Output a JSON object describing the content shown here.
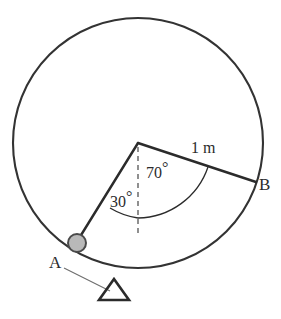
{
  "figure": {
    "type": "physics-diagram",
    "colors": {
      "stroke": "#2b2b2b",
      "circle_stroke": "#333333",
      "ball_fill": "#b9b9b9",
      "ball_stroke": "#4a4a4a",
      "leader_line": "#6e6e6e",
      "dashed_line": "#555555",
      "background": "#ffffff",
      "text": "#2b2b2b"
    },
    "geometry": {
      "circle": {
        "cx": 138,
        "cy": 143,
        "r": 125
      },
      "pivot": {
        "x": 138,
        "y": 143
      },
      "point_a": {
        "x": 77,
        "y": 243
      },
      "point_b": {
        "x": 255,
        "y": 182
      },
      "ball_radius": 9,
      "dashed_reference_end": {
        "x": 138,
        "y": 232
      },
      "angle_a_deg": 30,
      "angle_b_deg": 70,
      "radius_length": "1 m"
    }
  },
  "labels": {
    "point_a": "A",
    "point_b": "B",
    "angle_a": "30",
    "angle_b": "70",
    "degree_symbol": "°",
    "radius_length": "1 m"
  },
  "elements": {
    "circle_name": "circular-path",
    "ball_name": "pendulum-bob",
    "support_name": "triangular-support",
    "leader_name": "support-leader-line"
  }
}
